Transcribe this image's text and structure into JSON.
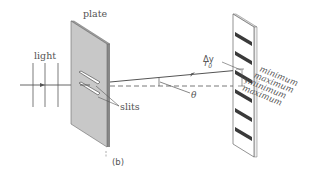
{
  "figure": {
    "panel_label": "(b)",
    "labels": {
      "plate": "plate",
      "light": "light",
      "slits": "slits",
      "r0": "r",
      "r0_sub": "0",
      "theta": "θ",
      "delta_y": "Δy",
      "y": "y"
    },
    "fringe_labels": [
      "minimum",
      "maximum",
      "minimum",
      "maximum"
    ],
    "colors": {
      "plate_fill": "#c8c8c8",
      "plate_edge": "#6a6a6a",
      "screen_band": "#3a3a3a",
      "line": "#555555",
      "wave": "#9a9a9a",
      "text": "#555555"
    }
  }
}
